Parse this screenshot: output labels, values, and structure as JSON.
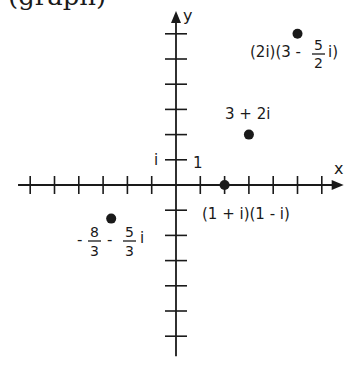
{
  "header": {
    "cut_title": "(graph)"
  },
  "chart_data": {
    "type": "scatter",
    "title": "",
    "xlabel": "x",
    "ylabel": "y",
    "xlim": [
      -6.5,
      6.9
    ],
    "ylim": [
      -6.8,
      6.9
    ],
    "x_ticks": [
      -6,
      -5,
      -4,
      -3,
      -2,
      -1,
      1,
      2,
      3,
      4,
      5,
      6
    ],
    "y_ticks": [
      -6,
      -5,
      -4,
      -3,
      -2,
      -1,
      1,
      2,
      3,
      4,
      5,
      6
    ],
    "tick_labels": {
      "x_unit": "1",
      "y_unit": "i"
    },
    "grid": false,
    "points": [
      {
        "name": "(2i)(3 - 5/2 i)",
        "x": 5,
        "y": 6,
        "label_parts": {
          "prefix": "(2i)(3 - ",
          "num": "5",
          "den": "2",
          "suffix": "i)"
        }
      },
      {
        "name": "3 + 2i",
        "x": 3,
        "y": 2,
        "label_parts": {
          "text": "3 + 2i"
        }
      },
      {
        "name": "(1 + i)(1 - i)",
        "x": 2,
        "y": 0,
        "label_parts": {
          "text": "(1 + i)(1 - i)"
        }
      },
      {
        "name": "-8/3 - 5/3 i",
        "x": -2.6667,
        "y": -1.3333,
        "label_parts": {
          "sign1": "-",
          "num1": "8",
          "den1": "3",
          "sign2": "-",
          "num2": "5",
          "den2": "3",
          "suffix": "i"
        }
      }
    ],
    "colors": {
      "ink": "#1a1a1a",
      "background": "#ffffff"
    }
  }
}
